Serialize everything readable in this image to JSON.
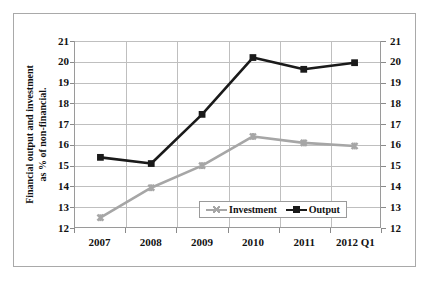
{
  "chart_data": {
    "type": "line",
    "title": "",
    "xlabel": "",
    "ylabel": "Financial output and investment as % of non-financial.",
    "ylabel_line1": "Financial output and investment",
    "ylabel_line2": "as % of non-financial.",
    "categories": [
      "2007",
      "2008",
      "2009",
      "2010",
      "2011",
      "2012 Q1"
    ],
    "ylim": [
      12,
      21
    ],
    "yticks": [
      12,
      13,
      14,
      15,
      16,
      17,
      18,
      19,
      20,
      21
    ],
    "ytick_labels": [
      "12",
      "13",
      "14",
      "15",
      "16",
      "17",
      "18",
      "19",
      "20",
      "21"
    ],
    "right_axis": true,
    "right_ytick_labels": [
      "12",
      "13",
      "14",
      "15",
      "16",
      "17",
      "18",
      "19",
      "20",
      "21"
    ],
    "grid": true,
    "legend_position": "inside-bottom-center",
    "series": [
      {
        "name": "Investment",
        "color": "#a6a6a6",
        "marker": "x-star",
        "values": [
          12.45,
          13.9,
          14.97,
          16.38,
          16.07,
          15.92
        ]
      },
      {
        "name": "Output",
        "color": "#1a1a1a",
        "marker": "square",
        "values": [
          15.37,
          15.07,
          17.45,
          20.2,
          19.63,
          19.95
        ]
      }
    ]
  },
  "legend": {
    "items": [
      {
        "label": "Investment"
      },
      {
        "label": "Output"
      }
    ]
  },
  "colors": {
    "investment": "#a6a6a6",
    "output": "#1a1a1a",
    "grid": "#bfbfbf",
    "axis": "#9a9a9a",
    "frame": "#a9a9a9",
    "background": "#ffffff",
    "text": "#111111"
  }
}
